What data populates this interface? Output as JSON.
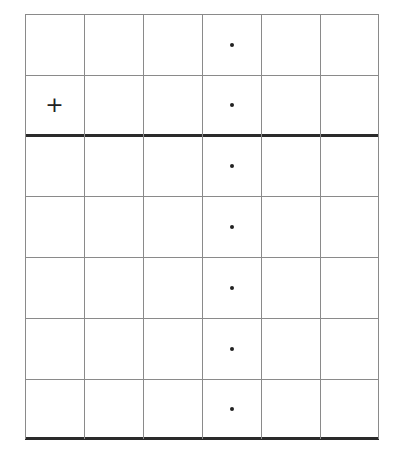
{
  "grid": {
    "columns": 6,
    "rows": 7,
    "col_edges": [
      0,
      59,
      118,
      177,
      236,
      295,
      354
    ],
    "row_edges": [
      0,
      61,
      121,
      182,
      243,
      304,
      365,
      425
    ],
    "thick_row_lines": [
      2,
      7
    ],
    "line_color": "#8a8a8a",
    "thick_line_color": "#2a2a2a"
  },
  "marks": [
    {
      "type": "plus",
      "symbol": "+",
      "row": 1,
      "col": 0
    },
    {
      "type": "dot",
      "row": 0,
      "col": 3
    },
    {
      "type": "dot",
      "row": 1,
      "col": 3
    },
    {
      "type": "dot",
      "row": 2,
      "col": 3
    },
    {
      "type": "dot",
      "row": 3,
      "col": 3
    },
    {
      "type": "dot",
      "row": 4,
      "col": 3
    },
    {
      "type": "dot",
      "row": 5,
      "col": 3
    },
    {
      "type": "dot",
      "row": 6,
      "col": 3
    }
  ]
}
